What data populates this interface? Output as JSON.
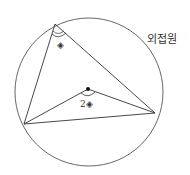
{
  "diagram": {
    "title_label": "외접원",
    "inscribed_angle_label": "◈",
    "central_angle_coefficient": "2",
    "central_angle_symbol": "◈",
    "circle": {
      "cx": 89,
      "cy": 92,
      "r": 74
    },
    "vertices": {
      "A": [
        55,
        24
      ],
      "B": [
        24,
        124
      ],
      "C": [
        155,
        113
      ]
    },
    "center": [
      88,
      89
    ],
    "colors": {
      "stroke": "#444444",
      "text": "#333333"
    }
  }
}
